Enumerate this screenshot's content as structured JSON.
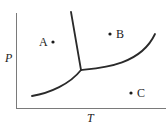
{
  "diagram": {
    "type": "phase-diagram",
    "axes": {
      "x_label": "T",
      "y_label": "P"
    },
    "curves": [
      {
        "name": "solid-liquid boundary",
        "description": "near-vertical line from top down to triple point, leaning slightly right"
      },
      {
        "name": "sublimation curve",
        "description": "curve rising from lower-left up to triple point"
      },
      {
        "name": "vaporization curve",
        "description": "curve from triple point rising to upper-right"
      }
    ],
    "points": [
      {
        "id": "A",
        "label": "A",
        "region": "upper-left (left of solid-liquid line)"
      },
      {
        "id": "B",
        "label": "B",
        "region": "upper-right (between solid-liquid line and vaporization curve)"
      },
      {
        "id": "C",
        "label": "C",
        "region": "lower-right (below vaporization curve)"
      }
    ]
  }
}
